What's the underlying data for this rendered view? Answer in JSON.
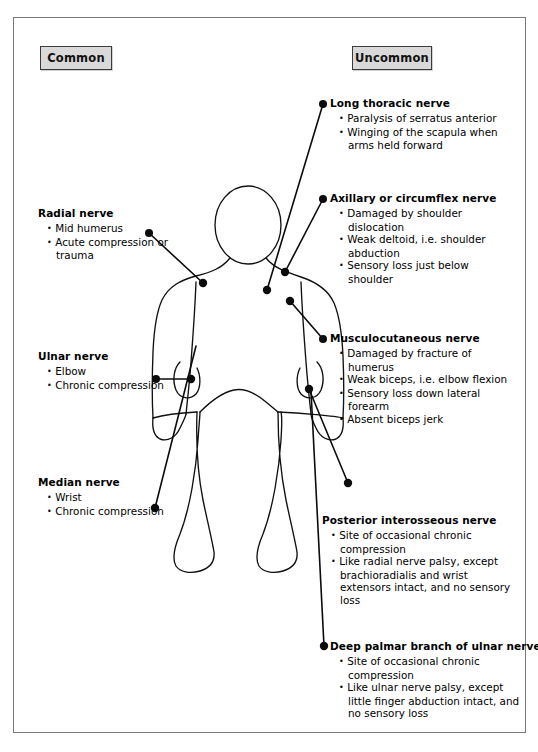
{
  "diagram": {
    "frame_border_color": "#7b7b7b"
  },
  "legend": {
    "common_label": "Common",
    "uncommon_label": "Uncommon",
    "chip_fill": "#d9d9d9",
    "chip_border": "#3a3a3a"
  },
  "figure": {
    "name": "human-body-outline",
    "stroke_color": "#111111"
  },
  "callouts": {
    "common": [
      {
        "id": "radial",
        "title": "Radial nerve",
        "bullets": [
          "Mid humerus",
          "Acute compression or trauma"
        ],
        "marker": {
          "x": 203,
          "y": 283
        }
      },
      {
        "id": "ulnar",
        "title": "Ulnar nerve",
        "bullets": [
          "Elbow",
          "Chronic compression"
        ],
        "marker": {
          "x": 191,
          "y": 379
        }
      },
      {
        "id": "median",
        "title": "Median nerve",
        "bullets": [
          "Wrist",
          "Chronic compression"
        ],
        "marker": {
          "x": 155,
          "y": 508
        }
      }
    ],
    "uncommon": [
      {
        "id": "long-thoracic",
        "title": "Long thoracic nerve",
        "bullets": [
          "Paralysis of serratus anterior",
          "Winging of the scapula when arms held forward"
        ],
        "marker": {
          "x": 267,
          "y": 290
        }
      },
      {
        "id": "axillary",
        "title": "Axillary or circumflex nerve",
        "bullets": [
          "Damaged by shoulder dislocation",
          "Weak deltoid, i.e. shoulder abduction",
          "Sensory loss just below shoulder"
        ],
        "marker": {
          "x": 285,
          "y": 272
        }
      },
      {
        "id": "musculocutaneous",
        "title": "Musculocutaneous nerve",
        "bullets": [
          "Damaged by fracture of humerus",
          "Weak biceps, i.e. elbow flexion",
          "Sensory loss down lateral forearm",
          "Absent biceps jerk"
        ],
        "marker": {
          "x": 290,
          "y": 301
        }
      },
      {
        "id": "posterior-interosseous",
        "title": "Posterior interosseous nerve",
        "bullets": [
          "Site of occasional chronic compression",
          "Like radial nerve palsy, except brachioradialis and wrist extensors intact, and no sensory loss"
        ],
        "marker": {
          "x": 348,
          "y": 483
        }
      },
      {
        "id": "deep-palmar",
        "title": "Deep palmar branch of ulnar nerve",
        "bullets": [
          "Site of occasional chronic compression",
          "Like ulnar nerve palsy, except little finger abduction intact, and no sensory loss"
        ],
        "marker": {
          "x": 324,
          "y": 646
        }
      }
    ]
  }
}
